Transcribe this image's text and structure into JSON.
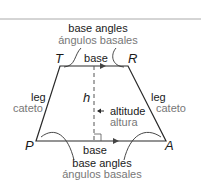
{
  "diagram": {
    "vertices": {
      "T": "T",
      "R": "R",
      "P": "P",
      "A": "A"
    },
    "altitude_symbol": "h",
    "labels": {
      "top_angles_en": "base angles",
      "top_angles_es": "ángulos basales",
      "top_base": "base",
      "bottom_base": "base",
      "left_leg_en": "leg",
      "left_leg_es": "cateto",
      "right_leg_en": "leg",
      "right_leg_es": "cateto",
      "altitude_en": "altitude",
      "altitude_es": "altura",
      "bottom_angles_en": "base angles",
      "bottom_angles_es": "ángulos basales"
    },
    "colors": {
      "line": "#2a2a2a",
      "spanish_text": "#777777",
      "rule": "#999999"
    }
  }
}
